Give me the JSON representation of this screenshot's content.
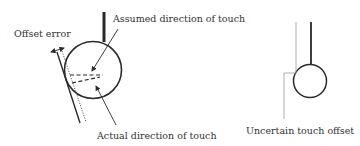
{
  "left_diagram": {
    "labels": {
      "offset_error": "Offset error",
      "assumed_direction": "Assumed direction of touch",
      "actual_direction": "Actual direction of touch"
    }
  },
  "right_diagram": {
    "labels": {
      "uncertain_offset": "Uncertain touch offset"
    }
  },
  "colors": {
    "stroke": "#2a2a2a",
    "light_stroke": "#9a9a9a",
    "text": "#333333"
  }
}
